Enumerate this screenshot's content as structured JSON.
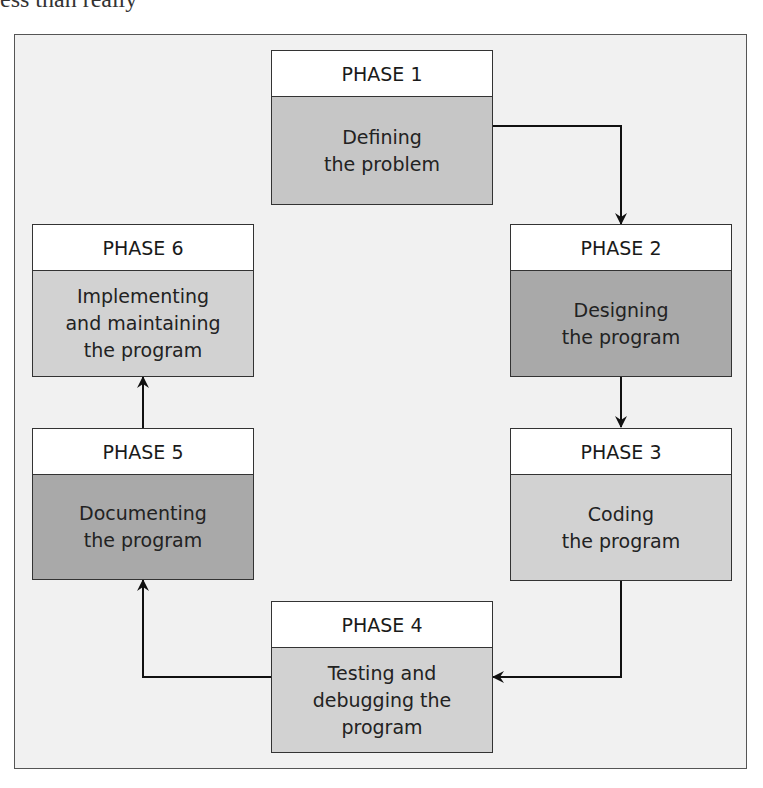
{
  "clipped_text": "ess than really",
  "diagram": {
    "colors": {
      "frame_bg": "#f1f1f1",
      "header_bg": "#ffffff",
      "dark_fill": "#a9a9a9",
      "mid_fill": "#c6c6c6",
      "light_fill": "#d2d2d2",
      "line": "#111111"
    },
    "phases": [
      {
        "label": "PHASE 1",
        "text": "Defining\nthe problem"
      },
      {
        "label": "PHASE 2",
        "text": "Designing\nthe program"
      },
      {
        "label": "PHASE 3",
        "text": "Coding\nthe program"
      },
      {
        "label": "PHASE 4",
        "text": "Testing and\ndebugging the\nprogram"
      },
      {
        "label": "PHASE 5",
        "text": "Documenting\nthe program"
      },
      {
        "label": "PHASE 6",
        "text": "Implementing\nand maintaining\nthe program"
      }
    ],
    "edges": [
      {
        "from": "PHASE 1",
        "to": "PHASE 2"
      },
      {
        "from": "PHASE 2",
        "to": "PHASE 3"
      },
      {
        "from": "PHASE 3",
        "to": "PHASE 4"
      },
      {
        "from": "PHASE 4",
        "to": "PHASE 5"
      },
      {
        "from": "PHASE 5",
        "to": "PHASE 6"
      }
    ]
  }
}
